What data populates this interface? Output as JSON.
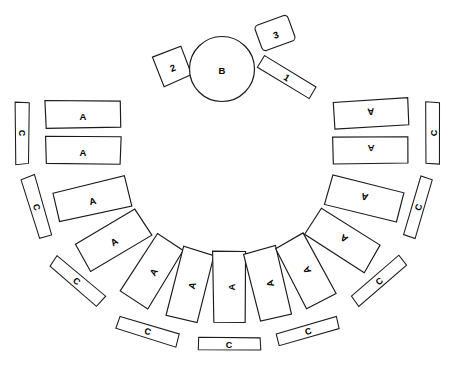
{
  "figure": {
    "background_color": "#ffffff",
    "stroke_color": "#1a1a1a",
    "label_color": "#000000",
    "width": 450,
    "height": 367,
    "top_fragment_text": "",
    "legend_letters": [
      "A",
      "B",
      "C"
    ],
    "legend_numbers": [
      "1",
      "2",
      "3"
    ]
  },
  "center": {
    "circle": {
      "label": "B",
      "cx": 222,
      "cy": 69,
      "r": 32.5
    }
  },
  "numbered": [
    {
      "id": "element-1",
      "label": "1",
      "shape": "bar",
      "cx": 287,
      "cy": 77,
      "w": 60,
      "h": 14,
      "rot": 32
    },
    {
      "id": "element-2",
      "label": "2",
      "shape": "square",
      "cx": 172,
      "cy": 66,
      "w": 31,
      "h": 31,
      "rot": -22
    },
    {
      "id": "element-3",
      "label": "3",
      "shape": "rounded",
      "cx": 275,
      "cy": 33,
      "w": 35,
      "h": 27,
      "rot": -20
    }
  ],
  "inner_ring": [
    {
      "id": "a-1",
      "label": "A",
      "cx": 83,
      "cy": 114,
      "w": 75,
      "h": 27,
      "rot": 0
    },
    {
      "id": "a-2",
      "label": "A",
      "cx": 83,
      "cy": 150,
      "w": 75,
      "h": 27,
      "rot": 0
    },
    {
      "id": "a-3",
      "label": "A",
      "cx": 92,
      "cy": 199,
      "w": 73,
      "h": 30,
      "rot": -13
    },
    {
      "id": "a-4",
      "label": "A",
      "cx": 113,
      "cy": 240,
      "w": 70,
      "h": 32,
      "rot": -31
    },
    {
      "id": "a-5",
      "label": "A",
      "cx": 152,
      "cy": 271,
      "w": 68,
      "h": 32,
      "rot": -58
    },
    {
      "id": "a-6",
      "label": "A",
      "cx": 190,
      "cy": 285,
      "w": 70,
      "h": 32,
      "rot": -75
    },
    {
      "id": "a-7",
      "label": "A",
      "cx": 229,
      "cy": 287,
      "w": 72,
      "h": 32,
      "rot": -90
    },
    {
      "id": "a-8",
      "label": "A",
      "cx": 268,
      "cy": 284,
      "w": 70,
      "h": 32,
      "rot": -104
    },
    {
      "id": "a-9",
      "label": "A",
      "cx": 305,
      "cy": 271,
      "w": 68,
      "h": 32,
      "rot": -118
    },
    {
      "id": "a-10",
      "label": "A",
      "cx": 343,
      "cy": 240,
      "w": 70,
      "h": 32,
      "rot": -148
    },
    {
      "id": "a-11",
      "label": "A",
      "cx": 364,
      "cy": 199,
      "w": 73,
      "h": 30,
      "rot": -166
    },
    {
      "id": "a-12",
      "label": "A",
      "cx": 371,
      "cy": 150,
      "w": 75,
      "h": 27,
      "rot": 180
    },
    {
      "id": "a-13",
      "label": "A",
      "cx": 371,
      "cy": 114,
      "w": 75,
      "h": 27,
      "rot": 176
    }
  ],
  "outer_ring": [
    {
      "id": "c-1",
      "label": "C",
      "cx": 22,
      "cy": 133,
      "w": 62,
      "h": 13,
      "rot": 90
    },
    {
      "id": "c-2",
      "label": "C",
      "cx": 37,
      "cy": 207,
      "w": 62,
      "h": 13,
      "rot": 73
    },
    {
      "id": "c-3",
      "label": "C",
      "cx": 77,
      "cy": 281,
      "w": 62,
      "h": 13,
      "rot": 40
    },
    {
      "id": "c-4",
      "label": "C",
      "cx": 148,
      "cy": 331,
      "w": 62,
      "h": 13,
      "rot": 17
    },
    {
      "id": "c-5",
      "label": "C",
      "cx": 229,
      "cy": 344,
      "w": 62,
      "h": 13,
      "rot": 0
    },
    {
      "id": "c-6",
      "label": "C",
      "cx": 308,
      "cy": 331,
      "w": 62,
      "h": 13,
      "rot": -17
    },
    {
      "id": "c-7",
      "label": "C",
      "cx": 379,
      "cy": 281,
      "w": 62,
      "h": 13,
      "rot": -40
    },
    {
      "id": "c-8",
      "label": "C",
      "cx": 418,
      "cy": 207,
      "w": 62,
      "h": 13,
      "rot": -73
    },
    {
      "id": "c-9",
      "label": "C",
      "cx": 433,
      "cy": 133,
      "w": 62,
      "h": 13,
      "rot": -90
    }
  ]
}
